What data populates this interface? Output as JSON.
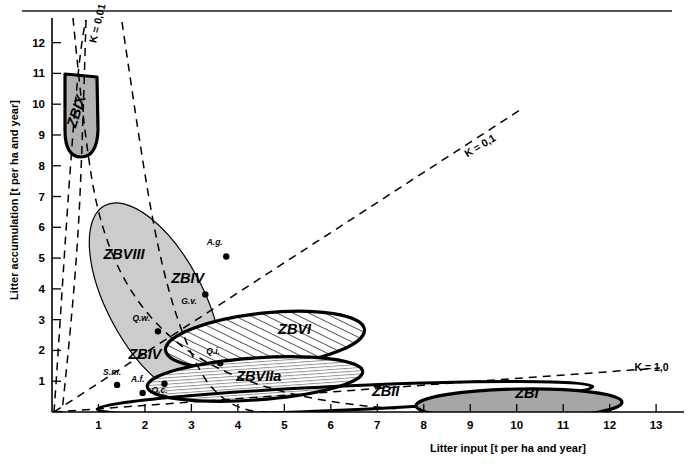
{
  "figure": {
    "background": "#ffffff",
    "rule_color": "#555555"
  },
  "chart_data": {
    "type": "scatter",
    "title": "",
    "xlabel": "Litter input  [t per ha and year]",
    "ylabel": "Litter accumulation [t per ha and year]",
    "xlim": [
      0,
      13.6
    ],
    "ylim": [
      0,
      12.8
    ],
    "grid": false,
    "legend_position": "none",
    "xticks": [
      1,
      2,
      3,
      4,
      5,
      6,
      7,
      8,
      9,
      10,
      11,
      12,
      13
    ],
    "yticks": [
      1,
      2,
      3,
      4,
      5,
      6,
      7,
      8,
      9,
      10,
      11,
      12
    ],
    "xtick_labels": [
      "1",
      "2",
      "3",
      "4",
      "5",
      "6",
      "7",
      "8",
      "9",
      "10",
      "11",
      "12",
      "13"
    ],
    "ytick_labels": [
      "1",
      "2",
      "3",
      "4",
      "5",
      "6",
      "7",
      "8",
      "9",
      "10",
      "11",
      "12"
    ],
    "annotations": [
      {
        "label": "K = 0,01",
        "x": 1.05,
        "y": 12.6,
        "rotation": -76
      },
      {
        "label": "K = 0,1",
        "x": 9.25,
        "y": 8.55,
        "rotation": -31
      },
      {
        "label": "K = 1,0",
        "x": 12.9,
        "y": 1.32,
        "rotation": 0
      }
    ],
    "k_curves": [
      {
        "name": "K = 0,01",
        "k": 0.01
      },
      {
        "name": "K = 0,1",
        "k": 0.1
      },
      {
        "name": "K = 1,0",
        "k": 1.0
      }
    ],
    "points": [
      {
        "label": "A.g.",
        "x": 3.75,
        "y": 5.05,
        "label_dx": -0.42,
        "label_dy": 0.38
      },
      {
        "label": "G.v.",
        "x": 3.3,
        "y": 3.82,
        "label_dx": -0.52,
        "label_dy": -0.3
      },
      {
        "label": "Q.w.",
        "x": 2.28,
        "y": 2.62,
        "label_dx": -0.55,
        "label_dy": 0.34
      },
      {
        "label": "Q.i.",
        "x": 3.62,
        "y": 1.58,
        "label_dx": -0.3,
        "label_dy": 0.32
      },
      {
        "label": "Q.c.",
        "x": 2.42,
        "y": 0.92,
        "label_dx": -0.28,
        "label_dy": -0.3
      },
      {
        "label": "S.m.",
        "x": 1.4,
        "y": 0.88,
        "label_dx": -0.3,
        "label_dy": 0.32
      },
      {
        "label": "A.f.",
        "x": 1.95,
        "y": 0.62,
        "label_dx": -0.25,
        "label_dy": 0.34
      }
    ],
    "zones": [
      {
        "name": "ZBIX",
        "label": "ZBIX",
        "label_x": 0.62,
        "label_y": 9.72,
        "label_rotation": -72,
        "fill": "#b3b3b3",
        "pattern": "solid",
        "outline": "thick",
        "shape": "u-blob"
      },
      {
        "name": "ZBVIII",
        "label": "ZBVIII",
        "label_x": 1.55,
        "label_y": 4.98,
        "label_rotation": 0,
        "fill": "none",
        "pattern": "none",
        "outline": "none",
        "shape": "open-region"
      },
      {
        "name": "ZBIV",
        "label": "ZBIV",
        "label_x": 2.92,
        "label_y": 4.18,
        "label_rotation": 0,
        "fill": "#cccccc",
        "pattern": "solid",
        "outline": "thin",
        "shape": "tilted-ellipse"
      },
      {
        "name": "ZBIVb",
        "label": "ZBIV",
        "label_x": 2.0,
        "label_y": 1.72,
        "label_rotation": 0,
        "fill": "none",
        "pattern": "none",
        "outline": "none",
        "shape": "inner-label"
      },
      {
        "name": "ZBVI",
        "label": "ZBVI",
        "label_x": 5.22,
        "label_y": 2.52,
        "label_rotation": 0,
        "fill": "#ffffff",
        "pattern": "diagonal-hatch",
        "outline": "thick",
        "shape": "ellipse"
      },
      {
        "name": "ZBVIIa",
        "label": "ZBVIIa",
        "label_x": 4.45,
        "label_y": 1.0,
        "label_rotation": 0,
        "fill": "#ffffff",
        "pattern": "horizontal-lines",
        "outline": "thick",
        "shape": "ellipse"
      },
      {
        "name": "ZBII",
        "label": "ZBII",
        "label_x": 7.18,
        "label_y": 0.52,
        "label_rotation": 0,
        "fill": "#ffffff",
        "pattern": "none",
        "outline": "thick",
        "shape": "flat-ellipse"
      },
      {
        "name": "ZBI",
        "label": "ZBI",
        "label_x": 10.22,
        "label_y": 0.44,
        "label_rotation": 0,
        "fill": "#a6a6a6",
        "pattern": "solid",
        "outline": "thick",
        "shape": "flat-ellipse"
      }
    ]
  }
}
